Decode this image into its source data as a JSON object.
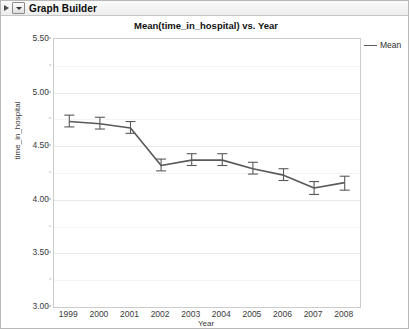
{
  "window": {
    "title": "Graph Builder",
    "disclosure_icon": "triangle-right-icon",
    "popup_icon": "chevron-down-icon"
  },
  "legend": {
    "position": "right",
    "entries": [
      {
        "label": "Mean",
        "swatch": "line-swatch",
        "color": "#595959"
      }
    ]
  },
  "chart_data": {
    "type": "line",
    "title": "Mean(time_in_hospital) vs. Year",
    "xlabel": "Year",
    "ylabel": "time_in_hospital",
    "grid": true,
    "legend_position": "right",
    "xlim": [
      1998.5,
      2008.5
    ],
    "ylim": [
      3.0,
      5.5
    ],
    "ytick_labels": [
      "5.50",
      "5.00",
      "4.50",
      "4.00",
      "3.50",
      "3.00"
    ],
    "ytick_values": [
      5.5,
      5.0,
      4.5,
      4.0,
      3.5,
      3.0
    ],
    "yminor_values": [
      5.25,
      4.75,
      4.25,
      3.75,
      3.25
    ],
    "categories": [
      1999,
      2000,
      2001,
      2002,
      2003,
      2004,
      2005,
      2006,
      2007,
      2008
    ],
    "xtick_labels": [
      "1999",
      "2000",
      "2001",
      "2002",
      "2003",
      "2004",
      "2005",
      "2006",
      "2007",
      "2008"
    ],
    "series": [
      {
        "name": "Mean",
        "color": "#595959",
        "error_bars": true,
        "values": [
          4.73,
          4.71,
          4.67,
          4.32,
          4.37,
          4.37,
          4.29,
          4.23,
          4.11,
          4.16
        ],
        "error_low": [
          4.68,
          4.66,
          4.62,
          4.27,
          4.32,
          4.32,
          4.24,
          4.18,
          4.05,
          4.09
        ],
        "error_high": [
          4.79,
          4.77,
          4.73,
          4.38,
          4.43,
          4.43,
          4.35,
          4.29,
          4.17,
          4.22
        ]
      }
    ]
  }
}
